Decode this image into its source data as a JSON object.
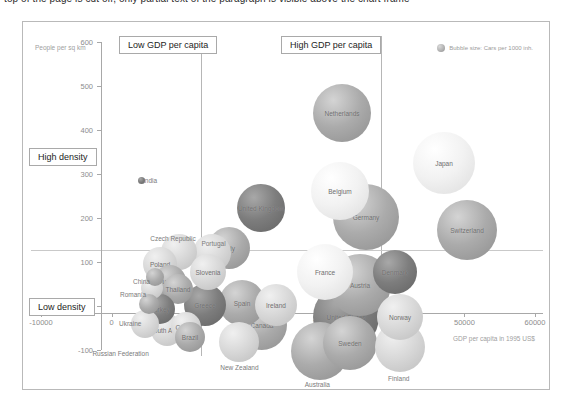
{
  "document": {
    "top_cut_text": "top of the page is cut off, only partial text of the paragraph is visible above the chart frame"
  },
  "legend": {
    "text": "Bubble size: Cars per 1000 inh.",
    "swatch_icon": "bubble-swatch-icon"
  },
  "annotations": {
    "low_gdp": "Low GDP per capita",
    "high_gdp": "High GDP per capita",
    "high_density": "High density",
    "low_density": "Low density"
  },
  "axes": {
    "y_title": "People per sq km",
    "x_title": "GDP per capita in 1995 US$",
    "y_ticks": [
      "600",
      "500",
      "400",
      "300",
      "200",
      "100",
      "0",
      "-100"
    ],
    "x_ticks": [
      "-10000",
      "0",
      "10000",
      "20000",
      "30000",
      "40000",
      "50000",
      "60000"
    ]
  },
  "colors": {
    "frame": "#b9b9b9",
    "axis": "#a8a8a8",
    "annotation_border": "#a9a9a9",
    "label_text": "#6d6d6d",
    "tick_text": "#8d8d8d"
  },
  "chart_data": {
    "type": "scatter",
    "title": "",
    "xlabel": "GDP per capita in 1995 US$",
    "ylabel": "People per sq km",
    "xlim": [
      -10000,
      60000
    ],
    "ylim": [
      -100,
      600
    ],
    "grid": false,
    "legend": "Bubble size: Cars per 1000 inh.",
    "size_encoding": "Cars per 1000 inh.",
    "quadrant_lines": {
      "vertical": [
        2500,
        25000
      ],
      "horizontal": [
        130
      ]
    },
    "points": [
      {
        "name": "India",
        "x": 1200,
        "y": 345,
        "size": 7
      },
      {
        "name": "China",
        "x": 2600,
        "y": 130,
        "size": 16
      },
      {
        "name": "Romania",
        "x": 2200,
        "y": 100,
        "size": 22
      },
      {
        "name": "Ukraine",
        "x": 1500,
        "y": 50,
        "size": 20
      },
      {
        "name": "Russian Federation",
        "x": 2700,
        "y": 5,
        "size": 26
      },
      {
        "name": "Poland",
        "x": 5600,
        "y": 160,
        "size": 34
      },
      {
        "name": "Czech Republic",
        "x": 7300,
        "y": 185,
        "size": 36
      },
      {
        "name": "Hungary",
        "x": 6200,
        "y": 130,
        "size": 32
      },
      {
        "name": "Thailand",
        "x": 6800,
        "y": 120,
        "size": 30
      },
      {
        "name": "Turkey",
        "x": 5400,
        "y": 70,
        "size": 30
      },
      {
        "name": "South Africa",
        "x": 5600,
        "y": 30,
        "size": 32
      },
      {
        "name": "Croatia",
        "x": 7400,
        "y": 35,
        "size": 30
      },
      {
        "name": "Brazil",
        "x": 7700,
        "y": 10,
        "size": 30
      },
      {
        "name": "Portugal",
        "x": 11500,
        "y": 185,
        "size": 38
      },
      {
        "name": "Slovenia",
        "x": 10800,
        "y": 135,
        "size": 36
      },
      {
        "name": "Greece",
        "x": 11800,
        "y": 60,
        "size": 42
      },
      {
        "name": "Italy",
        "x": 15000,
        "y": 165,
        "size": 42
      },
      {
        "name": "Spain",
        "x": 16500,
        "y": 75,
        "size": 46
      },
      {
        "name": "New Zealand",
        "x": 15600,
        "y": -45,
        "size": 40
      },
      {
        "name": "United Kingdom",
        "x": 17500,
        "y": 240,
        "size": 48
      },
      {
        "name": "Ireland",
        "x": 19500,
        "y": 55,
        "size": 42
      },
      {
        "name": "Canada",
        "x": 20500,
        "y": 10,
        "size": 50
      },
      {
        "name": "Netherlands",
        "x": 24500,
        "y": 465,
        "size": 40
      },
      {
        "name": "Belgium",
        "x": 24500,
        "y": 325,
        "size": 40
      },
      {
        "name": "Germany",
        "x": 27500,
        "y": 270,
        "size": 48
      },
      {
        "name": "France",
        "x": 25500,
        "y": 120,
        "size": 42
      },
      {
        "name": "Austria",
        "x": 27500,
        "y": 90,
        "size": 44
      },
      {
        "name": "United States",
        "x": 27500,
        "y": 20,
        "size": 52
      },
      {
        "name": "Denmark",
        "x": 32000,
        "y": 95,
        "size": 36
      },
      {
        "name": "Sweden",
        "x": 29000,
        "y": -35,
        "size": 40
      },
      {
        "name": "Australia",
        "x": 27000,
        "y": -55,
        "size": 44
      },
      {
        "name": "Finland",
        "x": 33000,
        "y": -55,
        "size": 38
      },
      {
        "name": "Norway",
        "x": 35000,
        "y": 10,
        "size": 40
      },
      {
        "name": "Switzerland",
        "x": 40500,
        "y": 215,
        "size": 44
      },
      {
        "name": "Japan",
        "x": 41500,
        "y": 345,
        "size": 42
      }
    ]
  },
  "bubbles": [
    {
      "name": "India",
      "left": 115,
      "top": 155,
      "d": 7,
      "tone": "dark",
      "label_pos": "right",
      "label_dx": 10,
      "label_dy": 0
    },
    {
      "name": "China",
      "left": 123,
      "top": 246,
      "d": 18,
      "tone": "mid",
      "label_pos": "left",
      "label_dx": -22,
      "label_dy": 5
    },
    {
      "name": "Romania",
      "left": 118,
      "top": 255,
      "d": 22,
      "tone": "light",
      "label_pos": "left",
      "label_dx": -32,
      "label_dy": 7
    },
    {
      "name": "Ukraine",
      "left": 116,
      "top": 272,
      "d": 20,
      "tone": "mid",
      "label_pos": "left",
      "label_dx": -30,
      "label_dy": 20
    },
    {
      "name": "Russian Federation",
      "left": 108,
      "top": 288,
      "d": 28,
      "tone": "light",
      "label_pos": "below",
      "label_dx": -22,
      "label_dy": 30
    },
    {
      "name": "Poland",
      "left": 120,
      "top": 225,
      "d": 34,
      "tone": "light",
      "label_pos": "inside",
      "label_dx": 0,
      "label_dy": 0
    },
    {
      "name": "Czech Republic",
      "left": 138,
      "top": 212,
      "d": 36,
      "tone": "light",
      "label_pos": "above",
      "label_dx": -5,
      "label_dy": -13
    },
    {
      "name": "Hungary",
      "left": 131,
      "top": 243,
      "d": 32,
      "tone": "mid",
      "label_pos": "inside",
      "label_dx": 0,
      "label_dy": 0
    },
    {
      "name": "Thailand",
      "left": 140,
      "top": 252,
      "d": 30,
      "tone": "mid",
      "label_pos": "inside",
      "label_dx": 0,
      "label_dy": 0
    },
    {
      "name": "Turkey",
      "left": 122,
      "top": 272,
      "d": 30,
      "tone": "dark",
      "label_pos": "inside",
      "label_dx": 0,
      "label_dy": 0
    },
    {
      "name": "South Africa",
      "left": 128,
      "top": 292,
      "d": 32,
      "tone": "light",
      "label_pos": "inside",
      "label_dx": 0,
      "label_dy": 0
    },
    {
      "name": "Croatia",
      "left": 148,
      "top": 290,
      "d": 30,
      "tone": "light",
      "label_pos": "inside",
      "label_dx": 0,
      "label_dy": 0
    },
    {
      "name": "Brazil",
      "left": 152,
      "top": 300,
      "d": 30,
      "tone": "mid",
      "label_pos": "inside",
      "label_dx": 0,
      "label_dy": 0
    },
    {
      "name": "Portugal",
      "left": 170,
      "top": 212,
      "d": 38,
      "tone": "light",
      "label_pos": "above",
      "label_dx": 3,
      "label_dy": -9
    },
    {
      "name": "Slovenia",
      "left": 167,
      "top": 232,
      "d": 36,
      "tone": "light",
      "label_pos": "inside",
      "label_dx": 0,
      "label_dy": 0
    },
    {
      "name": "Greece",
      "left": 161,
      "top": 262,
      "d": 42,
      "tone": "dark",
      "label_pos": "inside",
      "label_dx": 0,
      "label_dy": 0
    },
    {
      "name": "Italy",
      "left": 185,
      "top": 205,
      "d": 42,
      "tone": "mid",
      "label_pos": "inside",
      "label_dx": 0,
      "label_dy": 0
    },
    {
      "name": "Spain",
      "left": 196,
      "top": 258,
      "d": 46,
      "tone": "mid",
      "label_pos": "inside",
      "label_dx": 0,
      "label_dy": 0
    },
    {
      "name": "New Zealand",
      "left": 196,
      "top": 300,
      "d": 40,
      "tone": "light",
      "label_pos": "below",
      "label_dx": 0,
      "label_dy": 26
    },
    {
      "name": "United Kingdom",
      "left": 214,
      "top": 162,
      "d": 48,
      "tone": "dark",
      "label_pos": "inside",
      "label_dx": 0,
      "label_dy": 0
    },
    {
      "name": "Ireland",
      "left": 232,
      "top": 262,
      "d": 42,
      "tone": "light",
      "label_pos": "inside",
      "label_dx": 0,
      "label_dy": 0
    },
    {
      "name": "Canada",
      "left": 214,
      "top": 278,
      "d": 50,
      "tone": "mid",
      "label_pos": "inside",
      "label_dx": 0,
      "label_dy": 0
    },
    {
      "name": "Netherlands",
      "left": 290,
      "top": 62,
      "d": 58,
      "tone": "mid",
      "label_pos": "inside",
      "label_dx": 0,
      "label_dy": 0
    },
    {
      "name": "Belgium",
      "left": 288,
      "top": 140,
      "d": 58,
      "tone": "pale",
      "label_pos": "inside",
      "label_dx": 0,
      "label_dy": 0
    },
    {
      "name": "Germany",
      "left": 310,
      "top": 162,
      "d": 66,
      "tone": "mid",
      "label_pos": "inside",
      "label_dx": 0,
      "label_dy": 0
    },
    {
      "name": "France",
      "left": 274,
      "top": 222,
      "d": 56,
      "tone": "pale",
      "label_pos": "inside",
      "label_dx": 0,
      "label_dy": 0
    },
    {
      "name": "Austria",
      "left": 306,
      "top": 232,
      "d": 62,
      "tone": "mid",
      "label_pos": "inside",
      "label_dx": 0,
      "label_dy": 0
    },
    {
      "name": "United States",
      "left": 290,
      "top": 262,
      "d": 66,
      "tone": "dark",
      "label_pos": "inside",
      "label_dx": 0,
      "label_dy": 0
    },
    {
      "name": "Denmark",
      "left": 350,
      "top": 228,
      "d": 44,
      "tone": "dark",
      "label_pos": "inside",
      "label_dx": 0,
      "label_dy": 0
    },
    {
      "name": "Sweden",
      "left": 300,
      "top": 294,
      "d": 54,
      "tone": "mid",
      "label_pos": "inside",
      "label_dx": 0,
      "label_dy": 0
    },
    {
      "name": "Australia",
      "left": 268,
      "top": 300,
      "d": 58,
      "tone": "mid",
      "label_pos": "below",
      "label_dx": 0,
      "label_dy": 34
    },
    {
      "name": "Finland",
      "left": 352,
      "top": 300,
      "d": 50,
      "tone": "light",
      "label_pos": "below",
      "label_dx": 0,
      "label_dy": 32
    },
    {
      "name": "Norway",
      "left": 354,
      "top": 272,
      "d": 46,
      "tone": "light",
      "label_pos": "inside",
      "label_dx": 0,
      "label_dy": 0
    },
    {
      "name": "Switzerland",
      "left": 414,
      "top": 178,
      "d": 60,
      "tone": "mid",
      "label_pos": "inside",
      "label_dx": 0,
      "label_dy": 0
    },
    {
      "name": "Japan",
      "left": 390,
      "top": 110,
      "d": 62,
      "tone": "pale",
      "label_pos": "inside",
      "label_dx": 0,
      "label_dy": 0
    }
  ]
}
